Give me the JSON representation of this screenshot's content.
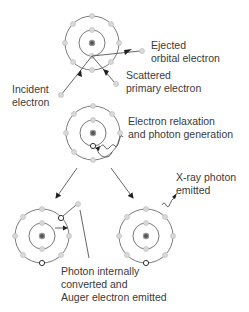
{
  "diagram": {
    "title": "",
    "colors": {
      "orbit": "#6a6a6a",
      "electron": "#d9d9d9",
      "vacancy": "#ffffff",
      "nucleus": "#555555",
      "text": "#3a3a3a"
    },
    "stages": [
      {
        "id": "ionization",
        "labels": {
          "ejected_line1": "Ejected",
          "ejected_line2": "orbital electron",
          "scattered_line1": "Scattered",
          "scattered_line2": "primary electron",
          "incident_line1": "Incident",
          "incident_line2": "electron"
        }
      },
      {
        "id": "relaxation",
        "labels": {
          "line1": "Electron relaxation",
          "line2": "and photon generation"
        }
      },
      {
        "id": "auger",
        "labels": {
          "line1": "Photon internally",
          "line2": "converted and",
          "line3": "Auger electron emitted"
        }
      },
      {
        "id": "xray",
        "labels": {
          "line1": "X-ray photon",
          "line2": "emitted"
        }
      }
    ]
  }
}
